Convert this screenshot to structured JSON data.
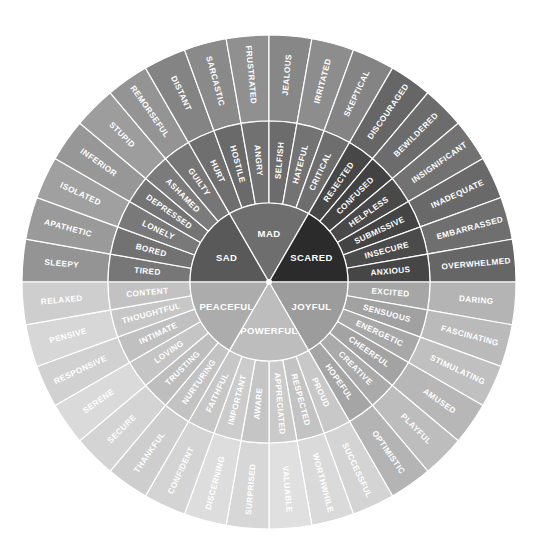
{
  "core": [
    {
      "label": "SAD",
      "color": "#595959",
      "middle": [
        "TIRED",
        "BORED",
        "LONELY",
        "DEPRESSED",
        "ASHAMED",
        "GUILTY"
      ],
      "middle_color": "#7a7a7a",
      "outer": [
        "SLEEPY",
        "APATHETIC",
        "ISOLATED",
        "INFERIOR",
        "STUPID",
        "REMORSEFUL"
      ],
      "outer_color": "#9a9a9a"
    },
    {
      "label": "MAD",
      "color": "#6e6e6e",
      "middle": [
        "HURT",
        "HOSTILE",
        "ANGRY",
        "SELFISH",
        "HATEFUL",
        "CRITICAL"
      ],
      "middle_color": "#727272",
      "outer": [
        "DISTANT",
        "SARCASTIC",
        "FRUSTRATED",
        "JEALOUS",
        "IRRITATED",
        "SKEPTICAL"
      ],
      "outer_color": "#8a8a8a"
    },
    {
      "label": "SCARED",
      "color": "#2b2b2b",
      "middle": [
        "REJECTED",
        "CONFUSED",
        "HELPLESS",
        "SUBMISSIVE",
        "INSECURE",
        "ANXIOUS"
      ],
      "middle_color": "#4a4a4a",
      "outer": [
        "DISCOURAGED",
        "BEWILDERED",
        "INSIGNIFICANT",
        "INADEQUATE",
        "EMBARRASSED",
        "OVERWHELMED"
      ],
      "outer_color": "#6c6c6c"
    },
    {
      "label": "JOYFUL",
      "color": "#9c9c9c",
      "middle": [
        "EXCITED",
        "SENSUOUS",
        "ENERGETIC",
        "CHEERFUL",
        "CREATIVE",
        "HOPEFUL"
      ],
      "middle_color": "#a9a9a9",
      "outer": [
        "DARING",
        "FASCINATING",
        "STIMULATING",
        "AMUSED",
        "PLAYFUL",
        "OPTIMISTIC"
      ],
      "outer_color": "#bababa"
    },
    {
      "label": "POWERFUL",
      "color": "#bdbdbd",
      "middle": [
        "PROUD",
        "RESPECTED",
        "APPRECIATED",
        "AWARE",
        "IMPORTANT",
        "FAITHFUL"
      ],
      "middle_color": "#cbcbcb",
      "outer": [
        "SUCCESSFUL",
        "WORTHWHILE",
        "VALUABLE",
        "SURPRISED",
        "DISCERNING",
        "CONFIDENT"
      ],
      "outer_color": "#dadada"
    },
    {
      "label": "PEACEFUL",
      "color": "#acacac",
      "middle": [
        "NURTURING",
        "TRUSTING",
        "LOVING",
        "INTIMATE",
        "THOUGHTFUL",
        "CONTENT"
      ],
      "middle_color": "#c6c6c6",
      "outer": [
        "THANKFUL",
        "SECURE",
        "SERENE",
        "RESPONSIVE",
        "PENSIVE",
        "RELAXED"
      ],
      "outer_color": "#d4d4d4"
    }
  ]
}
